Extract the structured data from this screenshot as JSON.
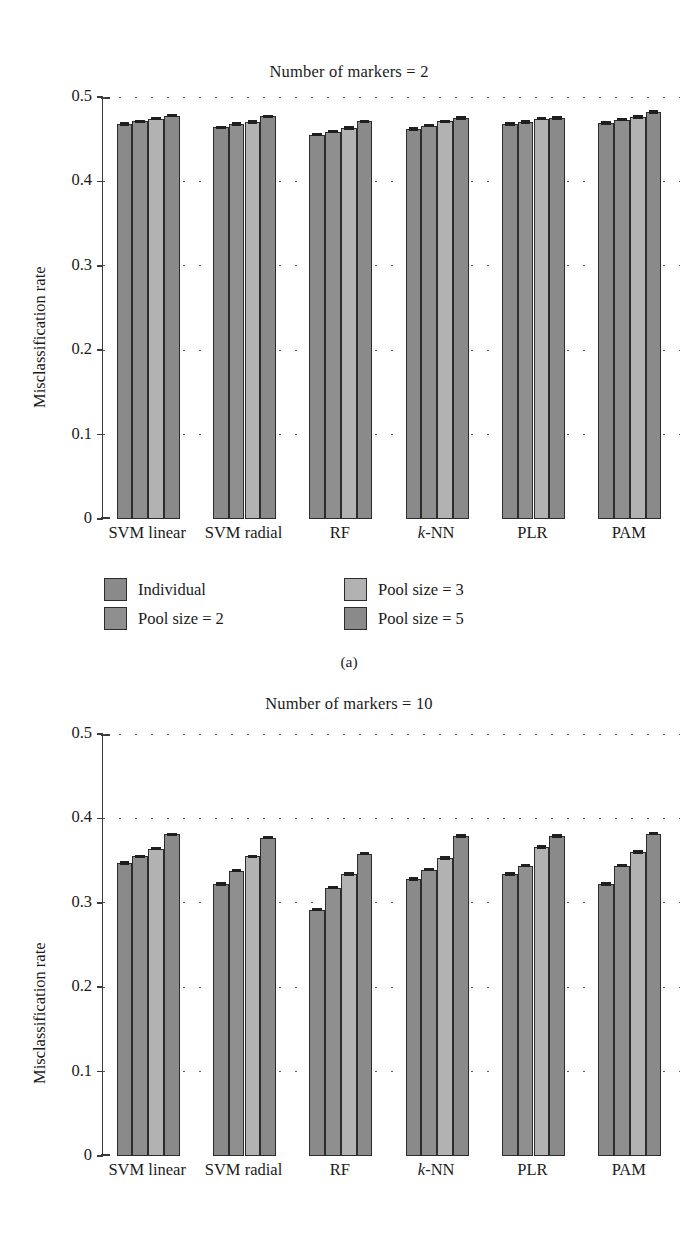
{
  "figure": {
    "subcaption_a": "(a)"
  },
  "legend": {
    "items": [
      {
        "label": "Individual",
        "color": "#8a8a8a"
      },
      {
        "label": "Pool size = 2",
        "color": "#8f8f8f"
      },
      {
        "label": "Pool size = 3",
        "color": "#b2b2b2"
      },
      {
        "label": "Pool size = 5",
        "color": "#8a8a8a"
      }
    ]
  },
  "panel_a": {
    "title": "Number of markers = 2",
    "ylabel": "Misclassification rate",
    "yticks": [
      "0",
      "0.1",
      "0.2",
      "0.3",
      "0.4",
      "0.5"
    ]
  },
  "panel_b": {
    "title": "Number of markers = 10",
    "ylabel": "Misclassification rate",
    "yticks": [
      "0",
      "0.1",
      "0.2",
      "0.3",
      "0.4",
      "0.5"
    ]
  },
  "chart_data": [
    {
      "type": "bar",
      "panel": "(a)",
      "title": "Number of markers = 2",
      "xlabel": "",
      "ylabel": "Misclassification rate",
      "ylim": [
        0,
        0.5
      ],
      "yticks": [
        0,
        0.1,
        0.2,
        0.3,
        0.4,
        0.5
      ],
      "grid": "horizontal-dotted",
      "legend_position": "below-plot",
      "categories": [
        "SVM linear",
        "SVM radial",
        "RF",
        "k-NN",
        "PLR",
        "PAM"
      ],
      "series": [
        {
          "name": "Individual",
          "values": [
            0.468,
            0.464,
            0.455,
            0.462,
            0.468,
            0.469
          ],
          "errors": [
            0.002,
            0.002,
            0.002,
            0.002,
            0.002,
            0.002
          ]
        },
        {
          "name": "Pool size = 2",
          "values": [
            0.471,
            0.468,
            0.459,
            0.466,
            0.47,
            0.473
          ],
          "errors": [
            0.002,
            0.002,
            0.002,
            0.002,
            0.002,
            0.002
          ]
        },
        {
          "name": "Pool size = 3",
          "values": [
            0.474,
            0.47,
            0.463,
            0.471,
            0.474,
            0.476
          ],
          "errors": [
            0.002,
            0.002,
            0.002,
            0.002,
            0.002,
            0.002
          ]
        },
        {
          "name": "Pool size = 5",
          "values": [
            0.478,
            0.477,
            0.471,
            0.475,
            0.475,
            0.482
          ],
          "errors": [
            0.002,
            0.002,
            0.002,
            0.002,
            0.002,
            0.002
          ]
        }
      ]
    },
    {
      "type": "bar",
      "panel": "(b)",
      "title": "Number of markers = 10",
      "xlabel": "",
      "ylabel": "Misclassification rate",
      "ylim": [
        0,
        0.5
      ],
      "yticks": [
        0,
        0.1,
        0.2,
        0.3,
        0.4,
        0.5
      ],
      "grid": "horizontal-dotted",
      "legend_position": "none",
      "categories": [
        "SVM linear",
        "SVM radial",
        "RF",
        "k-NN",
        "PLR",
        "PAM"
      ],
      "series": [
        {
          "name": "Individual",
          "values": [
            0.347,
            0.322,
            0.292,
            0.328,
            0.334,
            0.322
          ],
          "errors": [
            0.003,
            0.003,
            0.003,
            0.003,
            0.003,
            0.003
          ]
        },
        {
          "name": "Pool size = 2",
          "values": [
            0.355,
            0.338,
            0.318,
            0.339,
            0.344,
            0.344
          ],
          "errors": [
            0.003,
            0.003,
            0.003,
            0.003,
            0.003,
            0.003
          ]
        },
        {
          "name": "Pool size = 3",
          "values": [
            0.364,
            0.355,
            0.334,
            0.353,
            0.366,
            0.36
          ],
          "errors": [
            0.003,
            0.003,
            0.003,
            0.003,
            0.003,
            0.003
          ]
        },
        {
          "name": "Pool size = 5",
          "values": [
            0.381,
            0.377,
            0.358,
            0.379,
            0.379,
            0.382
          ],
          "errors": [
            0.003,
            0.003,
            0.003,
            0.003,
            0.003,
            0.003
          ]
        }
      ]
    }
  ]
}
